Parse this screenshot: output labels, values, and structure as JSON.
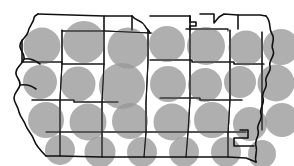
{
  "figure": {
    "kind": "proportional-symbol-map",
    "region_name": "Iowa",
    "background_color": "#ffffff",
    "boundary_color": "#1a1a1a",
    "symbol_color": "#999999",
    "symbol_opacity": 0.78,
    "symbol_shape": "circle",
    "title": "",
    "subtitle": "",
    "legend": "",
    "annotations": []
  },
  "chart_data": {
    "type": "scatter",
    "title": "",
    "xlabel": "",
    "ylabel": "",
    "map_region": "Iowa",
    "symbol": "circle",
    "symbol_fill": "#999999",
    "symbol_opacity": 0.78,
    "grid": false,
    "legend_position": "none",
    "xlim": [
      0,
      294
    ],
    "ylim": [
      0,
      166
    ],
    "value_encoding": "circle radius proportional to value",
    "points": [
      {
        "id": "c-r1-01",
        "cx": 42,
        "cy": 46,
        "r": 18.5
      },
      {
        "id": "c-r1-02",
        "cx": 84,
        "cy": 42,
        "r": 21.0
      },
      {
        "id": "c-r1-03",
        "cx": 128,
        "cy": 48,
        "r": 20.5
      },
      {
        "id": "c-r1-04",
        "cx": 167,
        "cy": 44,
        "r": 18.0
      },
      {
        "id": "c-r1-05",
        "cx": 206,
        "cy": 46,
        "r": 19.0
      },
      {
        "id": "c-r1-06",
        "cx": 246,
        "cy": 48,
        "r": 17.5
      },
      {
        "id": "c-r1-07",
        "cx": 281,
        "cy": 47,
        "r": 18.0
      },
      {
        "id": "c-r2-01",
        "cx": 40,
        "cy": 82,
        "r": 17.0
      },
      {
        "id": "c-r2-02",
        "cx": 78,
        "cy": 84,
        "r": 17.5
      },
      {
        "id": "c-r2-03",
        "cx": 122,
        "cy": 86,
        "r": 23.0
      },
      {
        "id": "c-r2-04",
        "cx": 168,
        "cy": 84,
        "r": 18.0
      },
      {
        "id": "c-r2-05",
        "cx": 205,
        "cy": 85,
        "r": 17.0
      },
      {
        "id": "c-r2-06",
        "cx": 240,
        "cy": 82,
        "r": 16.0
      },
      {
        "id": "c-r2-07",
        "cx": 276,
        "cy": 83,
        "r": 18.5
      },
      {
        "id": "c-r3-01",
        "cx": 46,
        "cy": 120,
        "r": 18.0
      },
      {
        "id": "c-r3-02",
        "cx": 88,
        "cy": 122,
        "r": 18.5
      },
      {
        "id": "c-r3-03",
        "cx": 130,
        "cy": 121,
        "r": 18.0
      },
      {
        "id": "c-r3-04",
        "cx": 172,
        "cy": 122,
        "r": 18.5
      },
      {
        "id": "c-r3-05",
        "cx": 212,
        "cy": 120,
        "r": 18.0
      },
      {
        "id": "c-r3-06",
        "cx": 250,
        "cy": 124,
        "r": 17.0
      },
      {
        "id": "c-r3-07",
        "cx": 282,
        "cy": 120,
        "r": 17.0
      },
      {
        "id": "c-r4-01",
        "cx": 60,
        "cy": 150,
        "r": 15.0
      },
      {
        "id": "c-r4-02",
        "cx": 100,
        "cy": 152,
        "r": 15.5
      },
      {
        "id": "c-r4-03",
        "cx": 142,
        "cy": 152,
        "r": 15.0
      },
      {
        "id": "c-r4-04",
        "cx": 184,
        "cy": 152,
        "r": 15.0
      },
      {
        "id": "c-r4-05",
        "cx": 226,
        "cy": 152,
        "r": 15.0
      },
      {
        "id": "c-r4-06",
        "cx": 262,
        "cy": 154,
        "r": 14.0
      }
    ]
  }
}
